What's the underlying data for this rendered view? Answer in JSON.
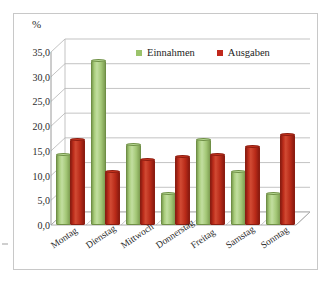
{
  "chart_data": {
    "type": "bar",
    "title": "",
    "xlabel": "",
    "ylabel": "%",
    "unit_label": "%",
    "ylim": [
      0,
      35
    ],
    "ytick_step": 5,
    "grid": true,
    "legend_position": "top-center",
    "style": "3d-cylinder-column",
    "categories": [
      "Montag",
      "Dienstag",
      "Mittwoch",
      "Donnerstag",
      "Freitag",
      "Samstag",
      "Sonntag"
    ],
    "ytick_labels": [
      "0,0",
      "5,0",
      "10,0",
      "15,0",
      "20,0",
      "25,0",
      "30,0",
      "35,0"
    ],
    "ytick_values": [
      0,
      5,
      10,
      15,
      20,
      25,
      30,
      35
    ],
    "series": [
      {
        "name": "Einnahmen",
        "color": "#9bc36b",
        "values": [
          14.0,
          33.0,
          16.0,
          6.0,
          17.0,
          10.5,
          6.0
        ]
      },
      {
        "name": "Ausgaben",
        "color": "#c0281c",
        "values": [
          17.0,
          10.5,
          13.0,
          13.5,
          14.0,
          15.5,
          18.0
        ]
      }
    ]
  },
  "legend": {
    "entries": [
      {
        "label": "Einnahmen",
        "color": "#9bc36b"
      },
      {
        "label": "Ausgaben",
        "color": "#c0281c"
      }
    ]
  },
  "colors": {
    "einnahmen": "#9bc36b",
    "ausgaben": "#c0281c",
    "gridline": "#b4b4b4",
    "frame": "#c8c8c8",
    "text": "#2b2b2b"
  }
}
